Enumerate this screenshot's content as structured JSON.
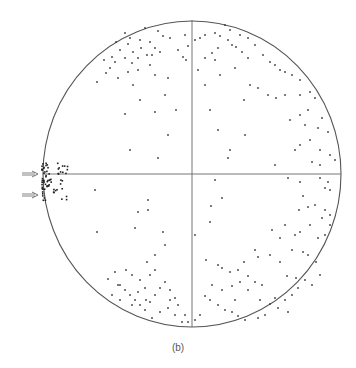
{
  "chart_data": {
    "type": "scatter",
    "title": "",
    "caption": "(b)",
    "xlabel": "",
    "ylabel": "",
    "grid": false,
    "legend": null,
    "frame": {
      "shape": "circle",
      "cx": 192,
      "cy": 174,
      "rx": 149,
      "ry": 153
    },
    "axes_lines": [
      {
        "x1": 43,
        "y1": 174,
        "x2": 341,
        "y2": 174
      },
      {
        "x1": 192,
        "y1": 20,
        "x2": 192,
        "y2": 327
      }
    ],
    "annotations": [
      {
        "type": "arrow",
        "x1": 22,
        "y1": 174,
        "x2": 38,
        "y2": 174
      },
      {
        "type": "arrow",
        "x1": 22,
        "y1": 195,
        "x2": 38,
        "y2": 195
      }
    ],
    "points": [
      [
        125,
        33
      ],
      [
        145,
        28
      ],
      [
        158,
        31
      ],
      [
        130,
        38
      ],
      [
        140,
        40
      ],
      [
        163,
        36
      ],
      [
        170,
        38
      ],
      [
        185,
        35
      ],
      [
        116,
        42
      ],
      [
        128,
        44
      ],
      [
        150,
        42
      ],
      [
        155,
        48
      ],
      [
        141,
        48
      ],
      [
        120,
        50
      ],
      [
        133,
        52
      ],
      [
        147,
        55
      ],
      [
        112,
        57
      ],
      [
        125,
        58
      ],
      [
        138,
        58
      ],
      [
        152,
        55
      ],
      [
        160,
        52
      ],
      [
        104,
        60
      ],
      [
        115,
        62
      ],
      [
        132,
        63
      ],
      [
        150,
        65
      ],
      [
        110,
        68
      ],
      [
        138,
        70
      ],
      [
        128,
        72
      ],
      [
        106,
        73
      ],
      [
        155,
        75
      ],
      [
        118,
        78
      ],
      [
        97,
        82
      ],
      [
        133,
        85
      ],
      [
        168,
        78
      ],
      [
        165,
        95
      ],
      [
        140,
        100
      ],
      [
        125,
        114
      ],
      [
        155,
        112
      ],
      [
        176,
        110
      ],
      [
        168,
        135
      ],
      [
        130,
        150
      ],
      [
        158,
        158
      ],
      [
        183,
        57
      ],
      [
        186,
        60
      ],
      [
        188,
        46
      ],
      [
        178,
        50
      ],
      [
        195,
        40
      ],
      [
        200,
        38
      ],
      [
        205,
        35
      ],
      [
        215,
        33
      ],
      [
        220,
        36
      ],
      [
        228,
        40
      ],
      [
        232,
        45
      ],
      [
        236,
        47
      ],
      [
        230,
        30
      ],
      [
        225,
        25
      ],
      [
        240,
        35
      ],
      [
        248,
        38
      ],
      [
        255,
        45
      ],
      [
        242,
        52
      ],
      [
        248,
        58
      ],
      [
        263,
        55
      ],
      [
        270,
        62
      ],
      [
        275,
        65
      ],
      [
        280,
        70
      ],
      [
        285,
        72
      ],
      [
        292,
        75
      ],
      [
        300,
        80
      ],
      [
        205,
        58
      ],
      [
        212,
        53
      ],
      [
        218,
        48
      ],
      [
        198,
        70
      ],
      [
        215,
        60
      ],
      [
        220,
        75
      ],
      [
        235,
        68
      ],
      [
        250,
        85
      ],
      [
        258,
        88
      ],
      [
        268,
        95
      ],
      [
        276,
        98
      ],
      [
        285,
        95
      ],
      [
        300,
        95
      ],
      [
        310,
        92
      ],
      [
        315,
        98
      ],
      [
        308,
        110
      ],
      [
        300,
        115
      ],
      [
        290,
        120
      ],
      [
        305,
        125
      ],
      [
        318,
        128
      ],
      [
        322,
        118
      ],
      [
        328,
        132
      ],
      [
        310,
        140
      ],
      [
        300,
        145
      ],
      [
        295,
        150
      ],
      [
        320,
        150
      ],
      [
        335,
        160
      ],
      [
        330,
        155
      ],
      [
        320,
        165
      ],
      [
        312,
        162
      ],
      [
        210,
        110
      ],
      [
        218,
        130
      ],
      [
        245,
        135
      ],
      [
        275,
        165
      ],
      [
        230,
        150
      ],
      [
        228,
        158
      ],
      [
        244,
        100
      ],
      [
        205,
        85
      ],
      [
        215,
        180
      ],
      [
        222,
        198
      ],
      [
        211,
        206
      ],
      [
        210,
        222
      ],
      [
        195,
        235
      ],
      [
        288,
        178
      ],
      [
        300,
        182
      ],
      [
        320,
        178
      ],
      [
        328,
        182
      ],
      [
        325,
        188
      ],
      [
        330,
        190
      ],
      [
        303,
        196
      ],
      [
        299,
        210
      ],
      [
        308,
        207
      ],
      [
        315,
        205
      ],
      [
        325,
        210
      ],
      [
        330,
        215
      ],
      [
        322,
        218
      ],
      [
        310,
        225
      ],
      [
        300,
        232
      ],
      [
        295,
        235
      ],
      [
        285,
        225
      ],
      [
        272,
        230
      ],
      [
        280,
        238
      ],
      [
        318,
        238
      ],
      [
        325,
        235
      ],
      [
        330,
        225
      ],
      [
        292,
        250
      ],
      [
        303,
        252
      ],
      [
        308,
        255
      ],
      [
        316,
        262
      ],
      [
        280,
        262
      ],
      [
        287,
        276
      ],
      [
        296,
        278
      ],
      [
        305,
        280
      ],
      [
        312,
        285
      ],
      [
        320,
        275
      ],
      [
        262,
        285
      ],
      [
        275,
        298
      ],
      [
        285,
        300
      ],
      [
        292,
        295
      ],
      [
        298,
        288
      ],
      [
        270,
        304
      ],
      [
        278,
        308
      ],
      [
        288,
        312
      ],
      [
        265,
        315
      ],
      [
        258,
        318
      ],
      [
        245,
        320
      ],
      [
        238,
        316
      ],
      [
        232,
        312
      ],
      [
        225,
        310
      ],
      [
        218,
        305
      ],
      [
        210,
        300
      ],
      [
        205,
        296
      ],
      [
        212,
        285
      ],
      [
        222,
        290
      ],
      [
        232,
        286
      ],
      [
        240,
        282
      ],
      [
        248,
        290
      ],
      [
        255,
        282
      ],
      [
        248,
        276
      ],
      [
        238,
        270
      ],
      [
        230,
        272
      ],
      [
        222,
        268
      ],
      [
        244,
        262
      ],
      [
        258,
        257
      ],
      [
        260,
        300
      ],
      [
        235,
        300
      ],
      [
        218,
        265
      ],
      [
        206,
        260
      ],
      [
        255,
        250
      ],
      [
        270,
        255
      ],
      [
        195,
        320
      ],
      [
        200,
        315
      ],
      [
        163,
        232
      ],
      [
        165,
        245
      ],
      [
        155,
        255
      ],
      [
        147,
        262
      ],
      [
        150,
        275
      ],
      [
        140,
        280
      ],
      [
        132,
        275
      ],
      [
        126,
        270
      ],
      [
        115,
        272
      ],
      [
        120,
        285
      ],
      [
        125,
        290
      ],
      [
        130,
        295
      ],
      [
        135,
        300
      ],
      [
        140,
        305
      ],
      [
        145,
        310
      ],
      [
        150,
        302
      ],
      [
        155,
        295
      ],
      [
        160,
        288
      ],
      [
        165,
        282
      ],
      [
        170,
        290
      ],
      [
        175,
        298
      ],
      [
        168,
        308
      ],
      [
        160,
        312
      ],
      [
        152,
        318
      ],
      [
        178,
        305
      ],
      [
        175,
        315
      ],
      [
        132,
        305
      ],
      [
        138,
        292
      ],
      [
        145,
        288
      ],
      [
        120,
        300
      ],
      [
        112,
        295
      ],
      [
        97,
        232
      ],
      [
        146,
        300
      ],
      [
        155,
        270
      ],
      [
        170,
        300
      ],
      [
        185,
        315
      ],
      [
        188,
        322
      ],
      [
        182,
        322
      ],
      [
        95,
        190
      ],
      [
        135,
        228
      ],
      [
        138,
        212
      ],
      [
        148,
        210
      ],
      [
        148,
        200
      ],
      [
        118,
        285
      ],
      [
        108,
        279
      ]
    ],
    "cluster_left_edge": {
      "center": [
        47,
        185
      ],
      "approx_count": 70,
      "extent": {
        "x": [
          42,
          68
        ],
        "y": [
          163,
          202
        ]
      }
    }
  }
}
